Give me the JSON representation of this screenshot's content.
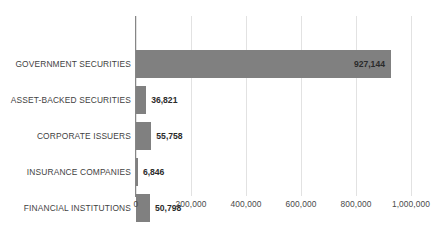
{
  "chart_data": {
    "type": "bar",
    "orientation": "horizontal",
    "title": "",
    "subtitle": "",
    "xlabel": "",
    "ylabel": "",
    "categories": [
      "GOVERNMENT SECURITIES",
      "ASSET-BACKED SECURITIES",
      "CORPORATE ISSUERS",
      "INSURANCE COMPANIES",
      "FINANCIAL INSTITUTIONS"
    ],
    "values": [
      927144,
      36821,
      55758,
      6846,
      50798
    ],
    "value_labels": [
      "927,144",
      "36,821",
      "55,758",
      "6,846",
      "50,798"
    ],
    "xlim": [
      0,
      1000000
    ],
    "tick_values": [
      0,
      200000,
      400000,
      600000,
      800000,
      1000000
    ],
    "tick_labels": [
      "0",
      "200,000",
      "400,000",
      "600,000",
      "800,000",
      "1,000,000"
    ],
    "grid": "vertical",
    "legend": "none",
    "bar_color": "#808080",
    "gridline_color": "#E2E2E2",
    "axis_line_color": "#868686",
    "label_color": "#3F3F3F",
    "data_label_color": "#2B2B2B"
  },
  "bars": [
    {
      "category": "GOVERNMENT SECURITIES",
      "value": 927144,
      "label": "927,144",
      "label_position": "inside"
    },
    {
      "category": "ASSET-BACKED SECURITIES",
      "value": 36821,
      "label": "36,821",
      "label_position": "outside"
    },
    {
      "category": "CORPORATE ISSUERS",
      "value": 55758,
      "label": "55,758",
      "label_position": "outside"
    },
    {
      "category": "INSURANCE COMPANIES",
      "value": 6846,
      "label": "6,846",
      "label_position": "outside"
    },
    {
      "category": "FINANCIAL INSTITUTIONS",
      "value": 50798,
      "label": "50,798",
      "label_position": "outside"
    }
  ]
}
